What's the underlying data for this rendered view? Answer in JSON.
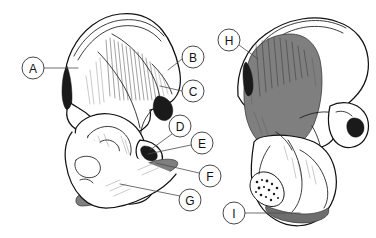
{
  "figure": {
    "background_color": "#ffffff",
    "line_color": "#121212",
    "shading_gray": "#807f7f",
    "shading_dark": "#1a1a1a",
    "leader_color": "#4b4b4b",
    "width": 376,
    "height": 238
  },
  "specimens": [
    {
      "id": "left-specimen",
      "name": "hip-bone-lateral-view",
      "view_label": "lateral"
    },
    {
      "id": "right-specimen",
      "name": "hip-bone-medial-view",
      "view_label": "medial"
    }
  ],
  "callouts": [
    {
      "letter": "A",
      "cx": 33,
      "cy": 68,
      "r": 11,
      "leader": "M 44 68 L 78 68",
      "target": "anterior-superior-iliac-spine"
    },
    {
      "letter": "B",
      "cx": 193,
      "cy": 57,
      "r": 11,
      "leader": "M 182 59 L 168 70",
      "target": "posterior-superior-iliac-spine"
    },
    {
      "letter": "C",
      "cx": 193,
      "cy": 91,
      "r": 11,
      "leader": "M 182 91 L 160 86",
      "target": "greater-sciatic-notch"
    },
    {
      "letter": "D",
      "cx": 180,
      "cy": 126,
      "r": 11,
      "leader": "M 172 134 L 150 150",
      "target": "ischial-spine"
    },
    {
      "letter": "E",
      "cx": 202,
      "cy": 143,
      "r": 11,
      "leader": "M 191 145 L 148 154",
      "target": "lesser-sciatic-notch"
    },
    {
      "letter": "F",
      "cx": 210,
      "cy": 176,
      "r": 11,
      "leader": "M 199 173 L 156 163",
      "target": "ischial-tuberosity"
    },
    {
      "letter": "G",
      "cx": 190,
      "cy": 200,
      "r": 11,
      "leader": "M 180 196 L 120 184",
      "target": "ischiopubic-ramus"
    },
    {
      "letter": "H",
      "cx": 229,
      "cy": 40,
      "r": 11,
      "leader": "M 239 45 L 258 59",
      "target": "iliac-fossa"
    },
    {
      "letter": "I",
      "cx": 234,
      "cy": 213,
      "r": 11,
      "leader": "M 245 213 L 300 213",
      "target": "auricular-surface"
    }
  ]
}
